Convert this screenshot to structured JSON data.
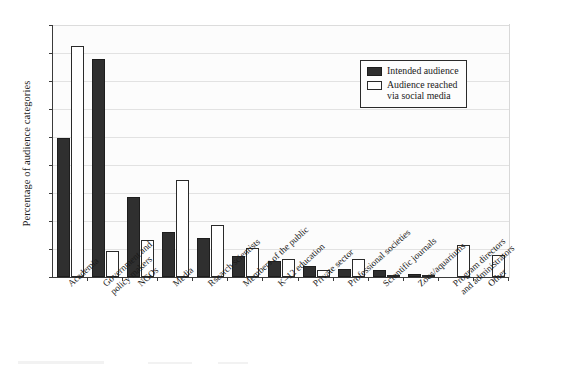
{
  "chart_data": {
    "type": "bar",
    "title": "",
    "xlabel": "",
    "ylabel": "Percentage of audience categories",
    "ylim": [
      0,
      45
    ],
    "yticks": [
      0,
      5,
      10,
      15,
      20,
      25,
      30,
      35,
      40,
      45
    ],
    "grid": true,
    "legend_position": "upper-right-inside",
    "categories": [
      "Academia",
      "Government and\npolicy makers",
      "NGOs",
      "Media",
      "Rsearch scientists",
      "Members of the public",
      "K–12 education",
      "Private sector",
      "Professional societies",
      "Scientific journals",
      "Zoos/aquariums",
      "Program directors\nand administrators",
      "Other"
    ],
    "series": [
      {
        "name": "Intended audience",
        "color": "#2f2f2f",
        "values": [
          24.8,
          39.0,
          14.2,
          8.1,
          7.0,
          3.8,
          2.8,
          2.0,
          1.5,
          1.2,
          0.6,
          0.0,
          0.0
        ]
      },
      {
        "name": "Audience reached via social media",
        "color": "#ffffff",
        "values": [
          41.2,
          4.7,
          6.6,
          17.4,
          9.2,
          5.2,
          3.2,
          1.3,
          3.3,
          0.4,
          0.2,
          5.7,
          4.0
        ]
      }
    ]
  },
  "legend": {
    "items": [
      {
        "label": "Intended audience",
        "swatch": "dark"
      },
      {
        "label": "Audience reached\nvia social media",
        "swatch": "light"
      }
    ]
  },
  "axis": {
    "y_title": "Percentage of audience categories"
  }
}
